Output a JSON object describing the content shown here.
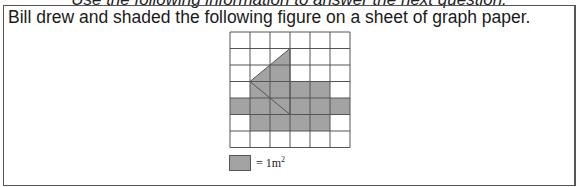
{
  "lead_in": "Use the following information to answer the next question.",
  "question": {
    "stem": "Bill drew and shaded the following figure on a sheet of graph paper."
  },
  "figure": {
    "grid_cols": 6,
    "grid_rows": 7,
    "cell_width": 20,
    "cell_height": 16.5,
    "shaded_color": "#a3a3a3",
    "line_color": "#555555",
    "shaded_cells": [
      [
        3,
        1
      ],
      [
        3,
        2
      ],
      [
        3,
        3
      ],
      [
        3,
        4
      ],
      [
        4,
        0
      ],
      [
        4,
        1
      ],
      [
        4,
        2
      ],
      [
        4,
        3
      ],
      [
        4,
        4
      ],
      [
        4,
        5
      ],
      [
        5,
        1
      ],
      [
        5,
        2
      ],
      [
        5,
        3
      ],
      [
        5,
        4
      ]
    ],
    "roof_polygon": [
      [
        1,
        3
      ],
      [
        3,
        1
      ],
      [
        5,
        3
      ]
    ]
  },
  "legend": {
    "label": "= 1m",
    "superscript": "2"
  }
}
